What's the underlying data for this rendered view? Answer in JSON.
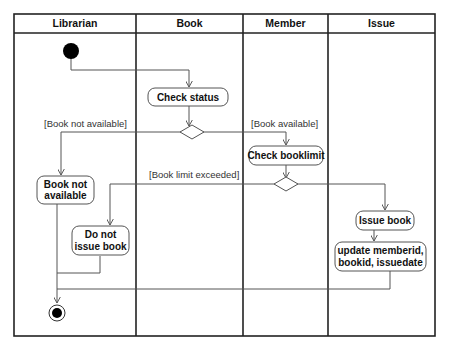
{
  "diagram": {
    "type": "UML activity diagram (swimlanes)",
    "lanes": [
      {
        "id": "librarian",
        "title": "Librarian"
      },
      {
        "id": "book",
        "title": "Book"
      },
      {
        "id": "member",
        "title": "Member"
      },
      {
        "id": "issue",
        "title": "Issue"
      }
    ],
    "nodes": {
      "start": {
        "kind": "initial",
        "lane": "librarian"
      },
      "check_status": {
        "kind": "action",
        "lane": "book",
        "lines": [
          "Check status"
        ]
      },
      "decision_status": {
        "kind": "decision",
        "lane": "book"
      },
      "book_not_available": {
        "kind": "action",
        "lane": "librarian",
        "lines": [
          "Book not",
          "available"
        ]
      },
      "check_booklimit": {
        "kind": "action",
        "lane": "member",
        "lines": [
          "Check booklimit"
        ]
      },
      "decision_limit": {
        "kind": "decision",
        "lane": "member"
      },
      "do_not_issue": {
        "kind": "action",
        "lane": "librarian",
        "lines": [
          "Do not",
          "issue book"
        ]
      },
      "issue_book": {
        "kind": "action",
        "lane": "issue",
        "lines": [
          "Issue book"
        ]
      },
      "update_record": {
        "kind": "action",
        "lane": "issue",
        "lines": [
          "update memberid,",
          "bookid, issuedate"
        ]
      },
      "end": {
        "kind": "final",
        "lane": "librarian"
      }
    },
    "guards": {
      "not_available": "[Book not available]",
      "available": "[Book available]",
      "limit_exceeded": "[Book limit exceeded]"
    },
    "edges": [
      {
        "from": "start",
        "to": "check_status"
      },
      {
        "from": "check_status",
        "to": "decision_status"
      },
      {
        "from": "decision_status",
        "to": "book_not_available",
        "guard": "[Book not available]"
      },
      {
        "from": "decision_status",
        "to": "check_booklimit",
        "guard": "[Book available]"
      },
      {
        "from": "check_booklimit",
        "to": "decision_limit"
      },
      {
        "from": "decision_limit",
        "to": "do_not_issue",
        "guard": "[Book limit exceeded]"
      },
      {
        "from": "decision_limit",
        "to": "issue_book"
      },
      {
        "from": "issue_book",
        "to": "update_record"
      },
      {
        "from": "book_not_available",
        "to": "end"
      },
      {
        "from": "do_not_issue",
        "to": "end"
      },
      {
        "from": "update_record",
        "to": "end"
      }
    ]
  },
  "colors": {
    "line": "#555555",
    "frame": "#222222",
    "text": "#111111",
    "background": "#ffffff"
  }
}
